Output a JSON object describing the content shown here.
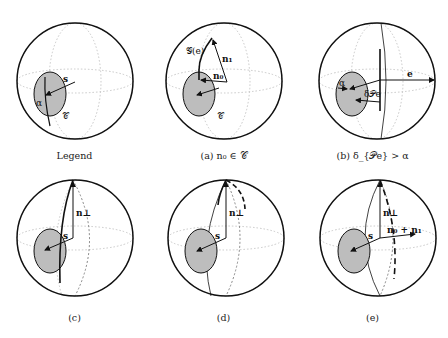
{
  "figure": {
    "panels": [
      {
        "id": "legend",
        "caption": "Legend",
        "labels": {
          "s": "s",
          "alpha": "α",
          "cone": "𝒞"
        }
      },
      {
        "id": "a",
        "caption": "(a) n₀ ∈ 𝒞",
        "labels": {
          "g": "𝒢(e)",
          "n1": "n₁",
          "n0": "n₀",
          "cone": "𝒞"
        }
      },
      {
        "id": "b",
        "caption": "(b) δ_{𝒫e} > α",
        "labels": {
          "e": "e",
          "alpha": "α",
          "delta": "δ𝒫e"
        }
      },
      {
        "id": "c",
        "caption": "(c)",
        "labels": {
          "nperp": "n⊥",
          "s": "s"
        }
      },
      {
        "id": "d",
        "caption": "(d)",
        "labels": {
          "nperp": "n⊥",
          "s": "s"
        }
      },
      {
        "id": "e",
        "caption": "(e)",
        "labels": {
          "nperp": "n⊥",
          "s": "s",
          "sum": "n₀ + n₁"
        }
      }
    ],
    "colors": {
      "outline": "#111111",
      "cone_fill": "#bdbdbd",
      "grid": "#c8c8c8"
    }
  }
}
